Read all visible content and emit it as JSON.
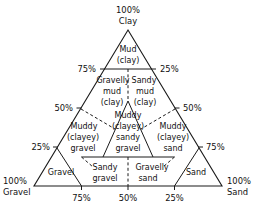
{
  "figure": {
    "type": "ternary-classification-diagram",
    "background_color": "#ffffff",
    "line_color": "#1a1a1a"
  },
  "corners": {
    "top": {
      "pct": "100%",
      "name": "Clay"
    },
    "bottom_left": {
      "pct": "100%",
      "name": "Gravel"
    },
    "bottom_right": {
      "pct": "100%",
      "name": "Sand"
    }
  },
  "axis_ticks": {
    "left_side": [
      {
        "label": "75%"
      },
      {
        "label": "50%"
      },
      {
        "label": "25%"
      }
    ],
    "right_side": [
      {
        "label": "25%"
      },
      {
        "label": "50%"
      },
      {
        "label": "75%"
      }
    ],
    "bottom_side": [
      {
        "label": "75%"
      },
      {
        "label": "50%"
      },
      {
        "label": "25%"
      }
    ]
  },
  "fields": [
    {
      "id": "mud-clay",
      "lines": [
        "Mud",
        "(clay)"
      ]
    },
    {
      "id": "gravelly-mud-clay",
      "lines": [
        "Gravelly",
        "mud",
        "(clay)"
      ]
    },
    {
      "id": "sandy-mud-clay",
      "lines": [
        "Sandy",
        "mud",
        "(clay)"
      ]
    },
    {
      "id": "muddy-clayey-gravel",
      "lines": [
        "Muddy",
        "(clayey)",
        "gravel"
      ]
    },
    {
      "id": "muddy-clayey-sandy-gravel",
      "lines": [
        "Muddy",
        "(clayey)",
        "sandy",
        "gravel"
      ]
    },
    {
      "id": "muddy-clayey-sand",
      "lines": [
        "Muddy",
        "(clayey)",
        "sand"
      ]
    },
    {
      "id": "gravel",
      "lines": [
        "Gravel"
      ]
    },
    {
      "id": "sandy-gravel",
      "lines": [
        "Sandy",
        "gravel"
      ]
    },
    {
      "id": "gravelly-sand",
      "lines": [
        "Gravelly",
        "sand"
      ]
    },
    {
      "id": "sand",
      "lines": [
        "Sand"
      ]
    }
  ],
  "labels": {
    "top_pct": "100%",
    "top_name": "Clay",
    "left_pct": "100%",
    "left_name": "Gravel",
    "right_pct": "100%",
    "right_name": "Sand",
    "t75": "75%",
    "t50": "50%",
    "t25": "25%",
    "l75": "75%",
    "l50": "50%",
    "l25": "25%",
    "r25": "25%",
    "r50": "50%",
    "r75": "75%",
    "b75": "75%",
    "b50": "50%",
    "b25": "25%",
    "mud_1": "Mud",
    "mud_2": "(clay)",
    "gmud_1": "Gravelly",
    "gmud_2": "mud",
    "gmud_3": "(clay)",
    "smud_1": "Sandy",
    "smud_2": "mud",
    "smud_3": "(clay)",
    "mcg_1": "Muddy",
    "mcg_2": "(clayey)",
    "mcg_3": "gravel",
    "mcsg_1": "Muddy",
    "mcsg_2": "(clayey)",
    "mcsg_3": "sandy",
    "mcsg_4": "gravel",
    "mcs_1": "Muddy",
    "mcs_2": "(clayey)",
    "mcs_3": "sand",
    "gravel_1": "Gravel",
    "sgravel_1": "Sandy",
    "sgravel_2": "gravel",
    "gsand_1": "Gravelly",
    "gsand_2": "sand",
    "sand_1": "Sand"
  }
}
